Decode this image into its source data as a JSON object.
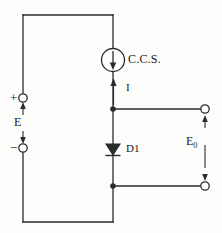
{
  "diagram": {
    "background_color": "#fdfdfb",
    "line_color": "#2b2b2b",
    "labels": {
      "current_source": "C.C.S.",
      "current": "I",
      "diode": "D1",
      "source_voltage": "E",
      "plus_terminal": "+",
      "minus_terminal": "−",
      "output_voltage": "E",
      "output_voltage_subscript": "0"
    },
    "components": [
      {
        "name": "constant-current-source",
        "type": "current-source",
        "label": "C.C.S.",
        "symbol": "circle-with-down-arrow",
        "cx": 113,
        "cy": 60,
        "r": 11
      },
      {
        "name": "diode-d1",
        "type": "diode",
        "label": "D1",
        "symbol": "triangle-down-with-bar",
        "cx": 113,
        "cy": 150
      },
      {
        "name": "source-terminal-positive",
        "type": "terminal",
        "label": "+",
        "cx": 23,
        "cy": 98
      },
      {
        "name": "source-terminal-negative",
        "type": "terminal",
        "label": "−",
        "cx": 23,
        "cy": 148
      },
      {
        "name": "output-terminal-top",
        "type": "terminal",
        "cx": 205,
        "cy": 109
      },
      {
        "name": "output-terminal-bottom",
        "type": "terminal",
        "cx": 205,
        "cy": 186
      },
      {
        "name": "node-top",
        "type": "junction",
        "cx": 113,
        "cy": 109
      },
      {
        "name": "node-bottom",
        "type": "junction",
        "cx": 113,
        "cy": 186
      }
    ],
    "annotations": [
      {
        "name": "current-arrow",
        "label": "I",
        "direction": "up",
        "x": 113,
        "y_from": 104,
        "y_to": 80
      },
      {
        "name": "source-voltage-arrow",
        "label": "E",
        "direction": "bidirectional",
        "x": 23,
        "y_from": 104,
        "y_to": 142
      },
      {
        "name": "output-voltage-arrow",
        "label": "E0",
        "direction": "bidirectional",
        "x": 205,
        "y_from": 115,
        "y_to": 180
      }
    ]
  }
}
